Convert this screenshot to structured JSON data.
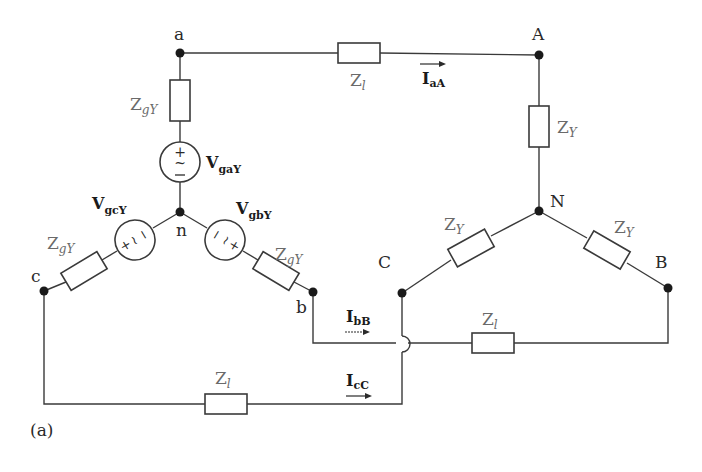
{
  "figure_label": "(a)",
  "nodes": {
    "a": "a",
    "n": "n",
    "b": "b",
    "c": "c",
    "A": "A",
    "N": "N",
    "B": "B",
    "C": "C"
  },
  "impedances": {
    "source_a": {
      "base": "Z",
      "sub": "gY"
    },
    "source_b": {
      "base": "Z",
      "sub": "gY"
    },
    "source_c": {
      "base": "Z",
      "sub": "gY"
    },
    "line_a": {
      "base": "Z",
      "sub": "l"
    },
    "line_b": {
      "base": "Z",
      "sub": "l"
    },
    "line_c": {
      "base": "Z",
      "sub": "l"
    },
    "load_a": {
      "base": "Z",
      "sub": "Y"
    },
    "load_b": {
      "base": "Z",
      "sub": "Y"
    },
    "load_c": {
      "base": "Z",
      "sub": "Y"
    }
  },
  "sources": {
    "a": {
      "base": "V",
      "sub": "gaY"
    },
    "b": {
      "base": "V",
      "sub": "gbY"
    },
    "c": {
      "base": "V",
      "sub": "gcY"
    }
  },
  "currents": {
    "aA": {
      "base": "I",
      "sub": "aA"
    },
    "bB": {
      "base": "I",
      "sub": "bB"
    },
    "cC": {
      "base": "I",
      "sub": "cC"
    }
  }
}
